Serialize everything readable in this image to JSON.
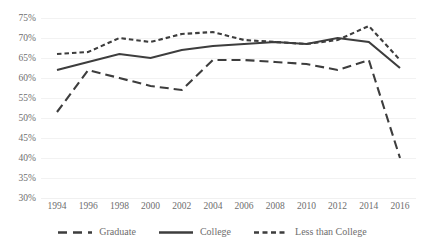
{
  "chart_data": {
    "type": "line",
    "title": "",
    "subtitle": "",
    "xlabel": "",
    "ylabel": "",
    "categories": [
      1994,
      1996,
      1998,
      2000,
      2002,
      2004,
      2006,
      2008,
      2010,
      2012,
      2014,
      2016
    ],
    "xtick_labels": [
      "1994",
      "1996",
      "1998",
      "2000",
      "2002",
      "2004",
      "2006",
      "2008",
      "2010",
      "2012",
      "2014",
      "2016"
    ],
    "ytick_labels": [
      "75%",
      "70%",
      "65%",
      "60%",
      "55%",
      "50%",
      "45%",
      "40%",
      "35%",
      "30%"
    ],
    "ytick_values": [
      75,
      70,
      65,
      60,
      55,
      50,
      45,
      40,
      35,
      30
    ],
    "ylim": [
      30,
      75
    ],
    "xlim": [
      1994,
      2016
    ],
    "grid": true,
    "grid_axis": "y",
    "legend_position": "bottom",
    "series": [
      {
        "name": "Graduate",
        "style": "long-dash",
        "color": "#3d3d3d",
        "values": [
          51.5,
          62.0,
          60.0,
          58.0,
          57.0,
          64.5,
          64.5,
          64.0,
          63.5,
          62.0,
          64.5,
          40.0
        ]
      },
      {
        "name": "College",
        "style": "solid",
        "color": "#3d3d3d",
        "values": [
          62.0,
          64.0,
          66.0,
          65.0,
          67.0,
          68.0,
          68.5,
          69.0,
          68.5,
          70.0,
          69.0,
          62.5
        ]
      },
      {
        "name": "Less than College",
        "style": "short-dash",
        "color": "#3d3d3d",
        "values": [
          66.0,
          66.5,
          70.0,
          69.0,
          71.0,
          71.5,
          69.5,
          69.0,
          68.5,
          69.5,
          73.0,
          64.5
        ]
      }
    ]
  },
  "legend": {
    "items": [
      {
        "label": "Graduate"
      },
      {
        "label": "College"
      },
      {
        "label": "Less than College"
      }
    ]
  },
  "colors": {
    "series_stroke": "#3d3d3d",
    "gridline": "#f2f2f2",
    "tick_text": "#6e6e6e",
    "background": "#ffffff"
  }
}
